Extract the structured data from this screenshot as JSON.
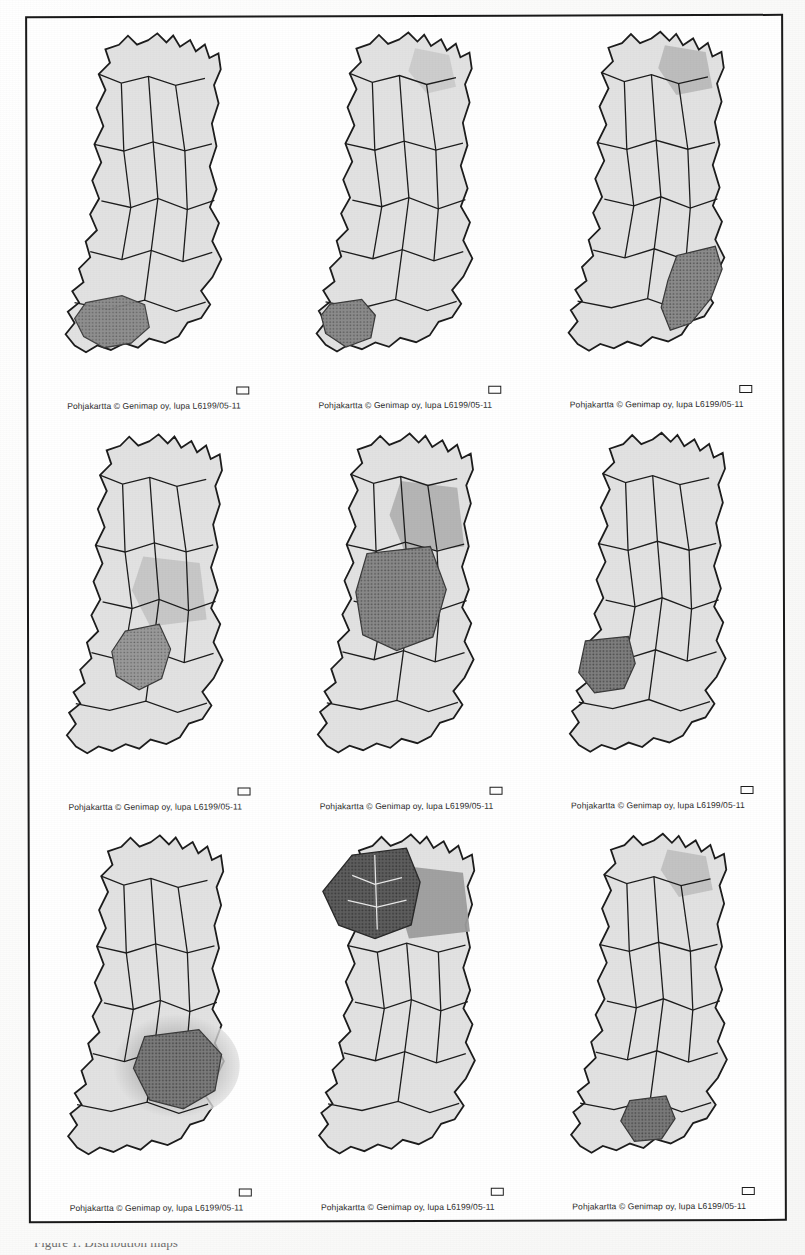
{
  "figure": {
    "kind": "map-grid",
    "rows": 3,
    "columns": 3,
    "country": "Finland",
    "frame_color": "#1a1a1a",
    "background_color": "#ffffff",
    "caption_text": "Pohjakartta © Genimap oy, lupa L6199/05-11",
    "scalebar_label": "",
    "bottom_cut_text": "Figure 1. Distribution maps",
    "palette": {
      "land_base": "#e2e2e2",
      "land_light": "#ededed",
      "highlight_mid": "#b4b4b4",
      "highlight_dark": "#8c8c8c",
      "highlight_darkest": "#6b6b6b",
      "outline": "#1d1d1d",
      "water_white": "#ffffff"
    },
    "panels": [
      {
        "index": 1,
        "position": "row1-col1",
        "caption": "Pohjakartta © Genimap oy, lupa L6199/05-11",
        "highlight_region": "Varsinais-Suomi / Southwest Finland",
        "highlight_location": "southwest",
        "highlight_intensity": "dark",
        "secondary_shading": "none"
      },
      {
        "index": 2,
        "position": "row1-col2",
        "caption": "Pohjakartta © Genimap oy, lupa L6199/05-11",
        "highlight_region": "Southwest coast / Turku archipelago",
        "highlight_location": "southwest-coast",
        "highlight_intensity": "dark",
        "secondary_shading": "light-north"
      },
      {
        "index": 3,
        "position": "row1-col3",
        "caption": "Pohjakartta © Genimap oy, lupa L6199/05-11",
        "highlight_region": "South Karelia / Kymenlaakso",
        "highlight_location": "southeast",
        "highlight_intensity": "dark",
        "secondary_shading": "medium-north"
      },
      {
        "index": 4,
        "position": "row2-col1",
        "caption": "Pohjakartta © Genimap oy, lupa L6199/05-11",
        "highlight_region": "Central Finland",
        "highlight_location": "central",
        "highlight_intensity": "medium",
        "secondary_shading": "light-surround"
      },
      {
        "index": 5,
        "position": "row2-col2",
        "caption": "Pohjakartta © Genimap oy, lupa L6199/05-11",
        "highlight_region": "Ostrobothnia / Central belt",
        "highlight_location": "central-west-belt",
        "highlight_intensity": "dark",
        "secondary_shading": "medium-north"
      },
      {
        "index": 6,
        "position": "row2-col3",
        "caption": "Pohjakartta © Genimap oy, lupa L6199/05-11",
        "highlight_region": "Satakunta",
        "highlight_location": "west-coast",
        "highlight_intensity": "dark",
        "secondary_shading": "none"
      },
      {
        "index": 7,
        "position": "row3-col1",
        "caption": "Pohjakartta © Genimap oy, lupa L6199/05-11",
        "highlight_region": "Savonia / Eastern lake district",
        "highlight_location": "east-central",
        "highlight_intensity": "dark",
        "secondary_shading": "gradient-halo"
      },
      {
        "index": 8,
        "position": "row3-col2",
        "caption": "Pohjakartta © Genimap oy, lupa L6199/05-11",
        "highlight_region": "Lapland",
        "highlight_location": "north",
        "highlight_intensity": "darkest",
        "secondary_shading": "medium-northeast"
      },
      {
        "index": 9,
        "position": "row3-col3",
        "caption": "Pohjakartta © Genimap oy, lupa L6199/05-11",
        "highlight_region": "Päijät-Häme / Southern Finland",
        "highlight_location": "south-central",
        "highlight_intensity": "dark",
        "secondary_shading": "light-north"
      }
    ]
  }
}
